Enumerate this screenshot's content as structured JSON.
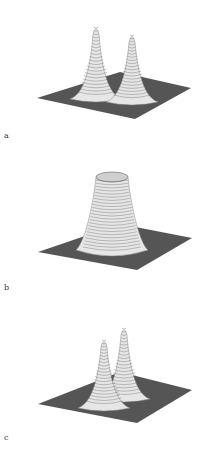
{
  "figure": {
    "panels": [
      {
        "label": "a",
        "description": "3D surface plot with two separated sharp peaks on a flat square base",
        "shape": "two-peaks-separated",
        "plane": {
          "left": [
            37,
            98
          ],
          "top": [
            120,
            72
          ],
          "right": [
            191,
            88
          ],
          "bottom": [
            135,
            119
          ]
        },
        "peaks": [
          {
            "x": 96,
            "y": 24,
            "base_y": 95,
            "half_width": 20
          },
          {
            "x": 132,
            "y": 32,
            "base_y": 98,
            "half_width": 20
          }
        ]
      },
      {
        "label": "b",
        "description": "3D surface plot with a single broad flat-topped plateau (truncated cone) on a flat square base",
        "shape": "plateau",
        "plane": {
          "left": [
            38,
            252
          ],
          "top": [
            120,
            224
          ],
          "right": [
            192,
            238
          ],
          "bottom": [
            137,
            270
          ]
        },
        "plateau": {
          "cx": 112,
          "top_y": 177,
          "top_rx": 16,
          "top_ry": 5,
          "base_y": 250,
          "base_rx": 30
        }
      },
      {
        "label": "c",
        "description": "3D surface plot with two close, overlapping sharp peaks on a flat square base",
        "shape": "two-peaks-close",
        "plane": {
          "left": [
            38,
            404
          ],
          "top": [
            120,
            372
          ],
          "right": [
            192,
            390
          ],
          "bottom": [
            137,
            423
          ]
        },
        "peaks": [
          {
            "x": 124,
            "y": 325,
            "base_y": 395,
            "half_width": 20
          },
          {
            "x": 104,
            "y": 337,
            "base_y": 404,
            "half_width": 20
          }
        ]
      }
    ]
  },
  "colors": {
    "background": "#ffffff",
    "plane": "#555555",
    "surface": "#e6e6e6",
    "contour": "#555555",
    "label": "#333333"
  }
}
